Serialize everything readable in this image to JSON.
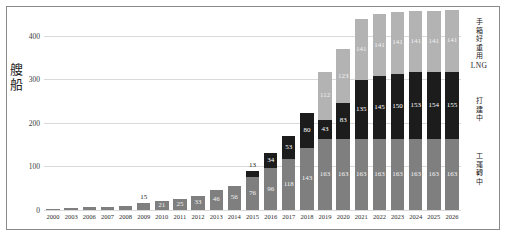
{
  "chart_data": {
    "type": "bar",
    "stacked": true,
    "title": "",
    "xlabel": "",
    "ylabel": "艘船",
    "ylim": [
      0,
      450
    ],
    "yticks": [
      0,
      100,
      200,
      300,
      400
    ],
    "grid": true,
    "legend_position": "right",
    "categories": [
      "2000",
      "2003",
      "2006",
      "2007",
      "2008",
      "2009",
      "2010",
      "2011",
      "2012",
      "2013",
      "2014",
      "2015",
      "2016",
      "2017",
      "2018",
      "2019",
      "2020",
      "2021",
      "2022",
      "2023",
      "2024",
      "2025",
      "2026"
    ],
    "series": [
      {
        "name": "工運轉中",
        "color": "#7f7f7f",
        "values": [
          2,
          4,
          6,
          8,
          10,
          15,
          21,
          25,
          33,
          46,
          56,
          76,
          96,
          118,
          143,
          163,
          163,
          163,
          163,
          163,
          163,
          163,
          163
        ],
        "labels": [
          "",
          "",
          "",
          "",
          "",
          "15",
          "21",
          "25",
          "33",
          "46",
          "56",
          "76",
          "96",
          "118",
          "143",
          "163",
          "163",
          "163",
          "163",
          "163",
          "163",
          "163",
          "163"
        ]
      },
      {
        "name": "打建中",
        "color": "#1c1c1c",
        "values": [
          0,
          0,
          0,
          0,
          0,
          0,
          0,
          0,
          0,
          0,
          0,
          13,
          34,
          53,
          80,
          43,
          83,
          135,
          145,
          150,
          153,
          154,
          155
        ],
        "labels": [
          "",
          "",
          "",
          "",
          "",
          "",
          "",
          "",
          "",
          "",
          "",
          "13",
          "34",
          "53",
          "80",
          "43",
          "83",
          "135",
          "145",
          "150",
          "153",
          "154",
          "155"
        ]
      },
      {
        "name": "手箱好重用 LNG",
        "color": "#b3b3b3",
        "values": [
          0,
          0,
          0,
          0,
          0,
          0,
          0,
          0,
          0,
          0,
          0,
          0,
          0,
          0,
          0,
          112,
          123,
          141,
          141,
          141,
          141,
          141,
          141
        ],
        "labels": [
          "",
          "",
          "",
          "",
          "",
          "",
          "",
          "",
          "",
          "",
          "",
          "",
          "",
          "",
          "",
          "112",
          "123",
          "141",
          "141",
          "141",
          "141",
          "141",
          "141"
        ]
      }
    ]
  },
  "axis": {
    "y_title_chars": [
      "艘",
      "船"
    ],
    "ytick_labels": [
      "400",
      "300",
      "200",
      "100",
      "0"
    ]
  },
  "legend": {
    "planned": {
      "cjk": [
        "手",
        "箱",
        "好",
        "重",
        "用"
      ],
      "latin": "LNG"
    },
    "building": {
      "cjk": [
        "打",
        "建",
        "中"
      ],
      "latin": ""
    },
    "operating": {
      "cjk": [
        "工",
        "運",
        "轉",
        "中"
      ],
      "latin": ""
    }
  }
}
